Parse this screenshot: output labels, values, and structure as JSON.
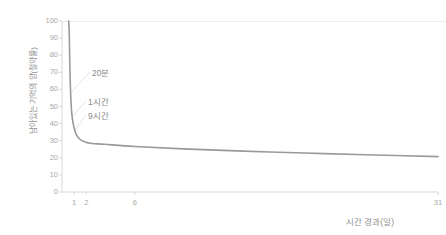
{
  "chart_data": {
    "type": "line",
    "title": "",
    "xlabel": "시간 경과(일)",
    "ylabel": "남아있는 기억의 양(절약률)",
    "xlim": [
      0,
      31
    ],
    "ylim": [
      0,
      100
    ],
    "grid": false,
    "legend": "none",
    "x_ticks": [
      {
        "value": 1,
        "label": "1"
      },
      {
        "value": 2,
        "label": "2"
      },
      {
        "value": 6,
        "label": "6"
      },
      {
        "value": 31,
        "label": "31"
      }
    ],
    "y_ticks": [
      {
        "value": 100,
        "label": "100"
      },
      {
        "value": 90,
        "label": "90"
      },
      {
        "value": 80,
        "label": "80"
      },
      {
        "value": 70,
        "label": "70"
      },
      {
        "value": 60,
        "label": "60"
      },
      {
        "value": 50,
        "label": "50"
      },
      {
        "value": 40,
        "label": "40"
      },
      {
        "value": 30,
        "label": "30"
      },
      {
        "value": 20,
        "label": "20"
      },
      {
        "value": 10,
        "label": "10"
      },
      {
        "value": 0,
        "label": "0"
      }
    ],
    "series": [
      {
        "name": "forgetting-curve",
        "color": "#9a9a9a",
        "points": [
          {
            "x": 0.55,
            "y": 100
          },
          {
            "x": 0.6,
            "y": 92
          },
          {
            "x": 0.63,
            "y": 80
          },
          {
            "x": 0.66,
            "y": 70
          },
          {
            "x": 0.7,
            "y": 60
          },
          {
            "x": 0.75,
            "y": 52
          },
          {
            "x": 0.82,
            "y": 45
          },
          {
            "x": 0.95,
            "y": 39
          },
          {
            "x": 1.15,
            "y": 34
          },
          {
            "x": 1.45,
            "y": 31
          },
          {
            "x": 1.9,
            "y": 29.3
          },
          {
            "x": 2.5,
            "y": 28.4
          },
          {
            "x": 3.5,
            "y": 27.9
          },
          {
            "x": 6,
            "y": 26.6
          },
          {
            "x": 10,
            "y": 25.2
          },
          {
            "x": 15,
            "y": 23.9
          },
          {
            "x": 20,
            "y": 22.8
          },
          {
            "x": 25,
            "y": 21.8
          },
          {
            "x": 31,
            "y": 20.7
          }
        ]
      }
    ],
    "annotations": [
      {
        "label": "20분",
        "value_y": 58,
        "note": "20 minutes elapsed"
      },
      {
        "label": "1시간",
        "value_y": 44,
        "note": "1 hour elapsed"
      },
      {
        "label": "9시간",
        "value_y": 36,
        "note": "9 hours elapsed"
      }
    ],
    "colors": {
      "line": "#9a9a9a",
      "axis": "#d8d8d8",
      "tick_text": "#a8a8a8",
      "label_text": "#8f8f8f",
      "annotation_text": "#8a8a8a",
      "leader_line": "#dadada",
      "background": "#ffffff"
    }
  }
}
